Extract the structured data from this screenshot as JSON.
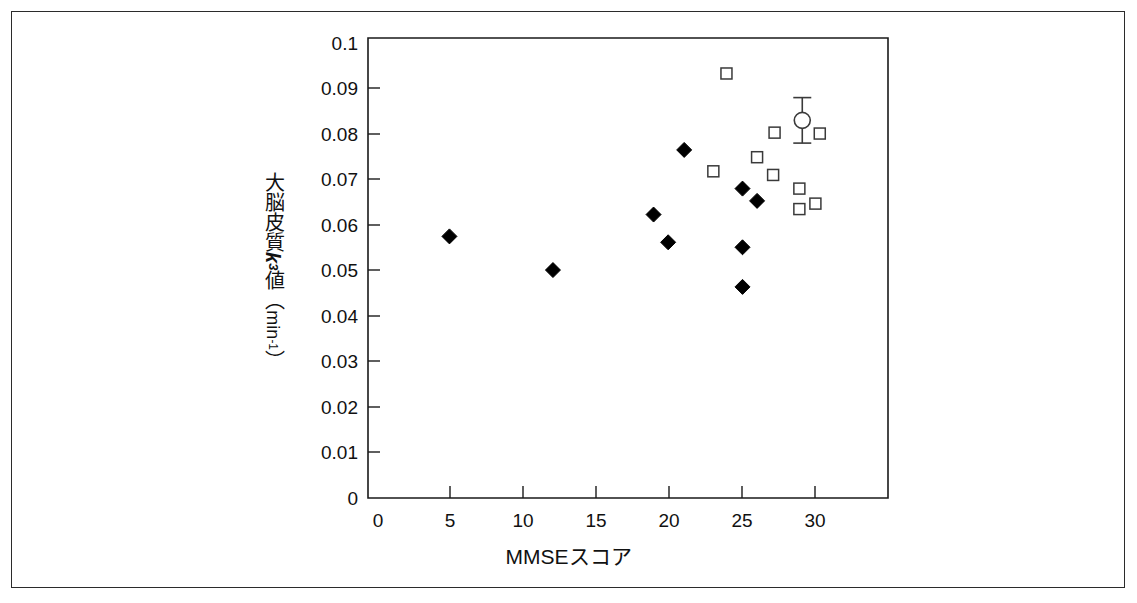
{
  "figure": {
    "border_color": "#2b2b2b",
    "marker_color": "#000000",
    "background": "#ffffff"
  },
  "axis": {
    "y_title_parts": {
      "prefix": "大脳皮質",
      "symbol": "k",
      "subscript": "3",
      "middle": "値",
      "unit_open": "（",
      "unit": "min",
      "unit_exp": "-1",
      "unit_close": "）"
    },
    "y_title_plain": "大脳皮質k3値（min-1）",
    "x_title": "MMSEスコア",
    "y_ticks": [
      "0",
      "0.01",
      "0.02",
      "0.03",
      "0.04",
      "0.05",
      "0.06",
      "0.07",
      "0.08",
      "0.09",
      "0.1"
    ],
    "x_ticks": [
      "0",
      "5",
      "10",
      "15",
      "20",
      "25",
      "30"
    ]
  },
  "chart_data": {
    "type": "scatter",
    "title": "",
    "xlabel": "MMSEスコア",
    "ylabel": "大脳皮質k3値（min-1）",
    "xlim": [
      0,
      35
    ],
    "ylim": [
      0,
      0.1
    ],
    "xticks": [
      0,
      5,
      10,
      15,
      20,
      25,
      30
    ],
    "yticks": [
      0,
      0.01,
      0.02,
      0.03,
      0.04,
      0.05,
      0.06,
      0.07,
      0.08,
      0.09,
      0.1
    ],
    "grid": false,
    "legend": "none",
    "series": [
      {
        "name": "filled-diamond",
        "marker": "diamond-filled",
        "points": [
          {
            "x": 4.9,
            "y": 0.0575
          },
          {
            "x": 12.0,
            "y": 0.0501
          },
          {
            "x": 18.9,
            "y": 0.0623
          },
          {
            "x": 19.9,
            "y": 0.0562
          },
          {
            "x": 21.0,
            "y": 0.0765
          },
          {
            "x": 25.0,
            "y": 0.068
          },
          {
            "x": 26.0,
            "y": 0.0653
          },
          {
            "x": 25.0,
            "y": 0.0551
          },
          {
            "x": 25.0,
            "y": 0.0464
          }
        ]
      },
      {
        "name": "open-square",
        "marker": "square-open",
        "points": [
          {
            "x": 23.9,
            "y": 0.0933
          },
          {
            "x": 23.0,
            "y": 0.0718
          },
          {
            "x": 27.2,
            "y": 0.0803
          },
          {
            "x": 30.3,
            "y": 0.0801
          },
          {
            "x": 26.0,
            "y": 0.0749
          },
          {
            "x": 27.1,
            "y": 0.071
          },
          {
            "x": 28.9,
            "y": 0.068
          },
          {
            "x": 28.9,
            "y": 0.0635
          },
          {
            "x": 30.0,
            "y": 0.0647
          }
        ]
      },
      {
        "name": "mean-open-circle",
        "marker": "circle-open-errorbar",
        "points": [
          {
            "x": 29.1,
            "y": 0.083,
            "err_low": 0.005,
            "err_high": 0.005
          }
        ]
      }
    ]
  }
}
